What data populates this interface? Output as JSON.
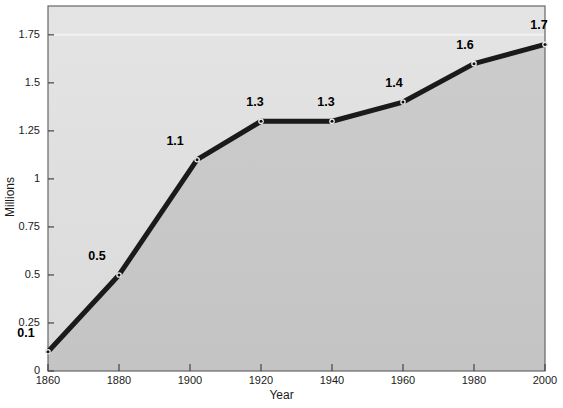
{
  "chart_data": {
    "type": "line",
    "title": "",
    "xlabel": "Year",
    "ylabel": "Millions",
    "x": [
      1860,
      1880,
      1902,
      1920,
      1940,
      1960,
      1980,
      2000
    ],
    "values": [
      0.1,
      0.5,
      1.1,
      1.3,
      1.3,
      1.4,
      1.6,
      1.7
    ],
    "point_labels": [
      "0.1",
      "0.5",
      "1.1",
      "1.3",
      "1.3",
      "1.4",
      "1.6",
      "1.7"
    ],
    "xtick_labels": [
      "1860",
      "1880",
      "1900",
      "1920",
      "1940",
      "1960",
      "1980",
      "2000"
    ],
    "xticks": [
      1860,
      1880,
      1900,
      1920,
      1940,
      1960,
      1980,
      2000
    ],
    "ytick_labels": [
      "0",
      "0.25",
      "0.5",
      "0.75",
      "1",
      "1.25",
      "1.5",
      "1.75"
    ],
    "yticks": [
      0,
      0.25,
      0.5,
      0.75,
      1,
      1.25,
      1.5,
      1.75
    ],
    "xlim": [
      1860,
      2000
    ],
    "ylim": [
      0,
      1.9
    ],
    "grid": false,
    "legend": "none",
    "series_name": "Millions",
    "line_color": "#1a1a1a",
    "marker_color": "#1a1a1a",
    "area_fill_color": "#c8c8c8",
    "plot_bg_color": "#e0e0e0",
    "highlight_gridline_value": 1.75,
    "highlight_gridline_color": "#f2f2f2"
  },
  "axis": {
    "x_title": "Year",
    "y_title": "Millions"
  }
}
